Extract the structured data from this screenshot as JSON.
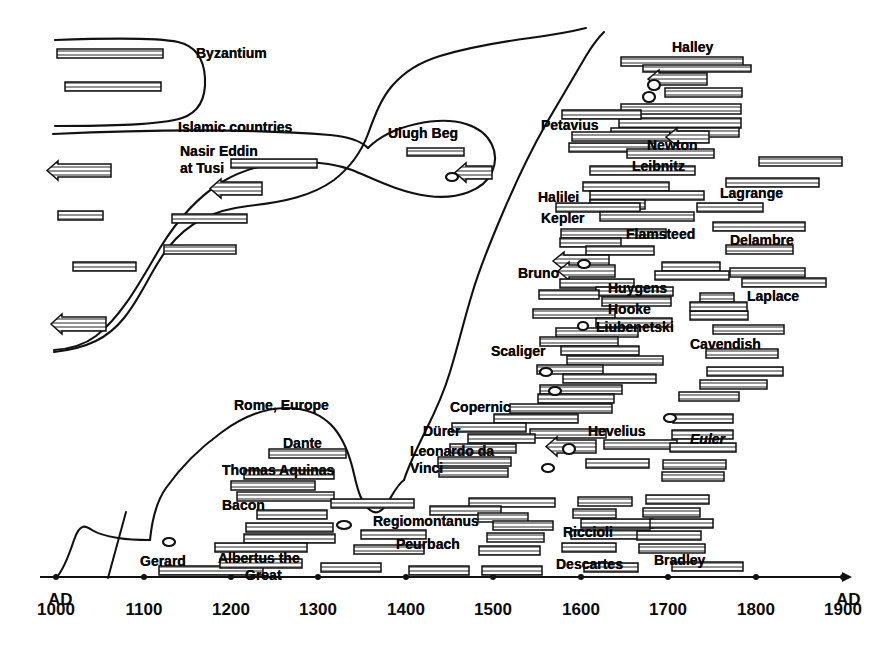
{
  "figure": {
    "kind": "historical-timeline",
    "background": "#ffffff",
    "ink": "#111111"
  },
  "axis": {
    "label_left": "1000\nAD",
    "label_right": "1900\nAD",
    "unit_suffix": "AD",
    "ticks": [
      {
        "value": 1000,
        "label": "1000",
        "x": 56
      },
      {
        "value": 1100,
        "label": "1100",
        "x": 144
      },
      {
        "value": 1200,
        "label": "1200",
        "x": 231
      },
      {
        "value": 1300,
        "label": "1300",
        "x": 318
      },
      {
        "value": 1400,
        "label": "1400",
        "x": 406
      },
      {
        "value": 1500,
        "label": "1500",
        "x": 493
      },
      {
        "value": 1600,
        "label": "1600",
        "x": 581
      },
      {
        "value": 1700,
        "label": "1700",
        "x": 668
      },
      {
        "value": 1800,
        "label": "1800",
        "x": 756
      },
      {
        "value": 1900,
        "label": "1900",
        "x": 843
      }
    ],
    "y": 577,
    "x_start": 40,
    "x_end": 850,
    "domain_min": 1000,
    "domain_max": 1900
  },
  "chart_data": {
    "type": "bar",
    "title": "",
    "xlabel": "AD",
    "ylabel": "",
    "xlim": [
      1000,
      1900
    ],
    "grid": false,
    "legend": "none",
    "note": "Horizontal hatched bars denote reign/life intervals of rulers and scholars; small ellipses denote very short intervals; left-pointing arrows denote intervals extending beyond the left edge of the plot. Curved freehand lines separate cultural regions.",
    "regions": [
      {
        "name": "Byzantium",
        "label_x": 196,
        "label_y": 46
      },
      {
        "name": "Islamic countries",
        "label_x": 178,
        "label_y": 120
      },
      {
        "name": "Nasir Eddin at Tusi",
        "label_x": 180,
        "label_y": 146
      },
      {
        "name": "Ulugh Beg",
        "label_x": 388,
        "label_y": 126
      },
      {
        "name": "Rome, Europe",
        "label_x": 234,
        "label_y": 398
      }
    ],
    "person_labels": [
      {
        "name": "Byzantium",
        "x": 196,
        "y": 46,
        "style": "plain"
      },
      {
        "name": "Islamic countries",
        "x": 178,
        "y": 120,
        "style": "plain"
      },
      {
        "name": "Nasir Eddin",
        "x": 180,
        "y": 144,
        "style": "plain"
      },
      {
        "name": "at Tusi",
        "x": 180,
        "y": 161,
        "style": "plain"
      },
      {
        "name": "Ulugh Beg",
        "x": 388,
        "y": 126,
        "style": "plain"
      },
      {
        "name": "Halley",
        "x": 672,
        "y": 40,
        "style": "plain"
      },
      {
        "name": "Petavius",
        "x": 541,
        "y": 118,
        "style": "plain"
      },
      {
        "name": "Newton",
        "x": 647,
        "y": 138,
        "style": "plain"
      },
      {
        "name": "Leibnitz",
        "x": 632,
        "y": 159,
        "style": "plain"
      },
      {
        "name": "Lagrange",
        "x": 720,
        "y": 186,
        "style": "plain"
      },
      {
        "name": "Halilei",
        "x": 538,
        "y": 190,
        "style": "plain"
      },
      {
        "name": "Kepler",
        "x": 541,
        "y": 211,
        "style": "plain"
      },
      {
        "name": "Flamsteed",
        "x": 626,
        "y": 227,
        "style": "plain"
      },
      {
        "name": "Delambre",
        "x": 730,
        "y": 233,
        "style": "plain"
      },
      {
        "name": "Bruno",
        "x": 518,
        "y": 266,
        "style": "plain"
      },
      {
        "name": "Huygens",
        "x": 608,
        "y": 281,
        "style": "plain"
      },
      {
        "name": "Laplace",
        "x": 747,
        "y": 289,
        "style": "plain"
      },
      {
        "name": "Hooke",
        "x": 608,
        "y": 302,
        "style": "plain"
      },
      {
        "name": "Liubenetski",
        "x": 596,
        "y": 320,
        "style": "plain"
      },
      {
        "name": "Cavendish",
        "x": 690,
        "y": 337,
        "style": "plain"
      },
      {
        "name": "Scaliger",
        "x": 491,
        "y": 344,
        "style": "plain"
      },
      {
        "name": "Copernic",
        "x": 450,
        "y": 400,
        "style": "plain"
      },
      {
        "name": "Rome, Europe",
        "x": 234,
        "y": 398,
        "style": "plain"
      },
      {
        "name": "Dante",
        "x": 283,
        "y": 436,
        "style": "plain"
      },
      {
        "name": "Hevelius",
        "x": 588,
        "y": 424,
        "style": "plain"
      },
      {
        "name": "Euler",
        "x": 690,
        "y": 432,
        "style": "italic"
      },
      {
        "name": "Dürer",
        "x": 423,
        "y": 424,
        "style": "plain"
      },
      {
        "name": "Leonardo da",
        "x": 410,
        "y": 444,
        "style": "plain"
      },
      {
        "name": "Vinci",
        "x": 410,
        "y": 461,
        "style": "plain"
      },
      {
        "name": "Thomas Aquinas",
        "x": 222,
        "y": 463,
        "style": "plain"
      },
      {
        "name": "Bacon",
        "x": 222,
        "y": 498,
        "style": "plain"
      },
      {
        "name": "Regiomontanus",
        "x": 373,
        "y": 514,
        "style": "plain"
      },
      {
        "name": "Riccioli",
        "x": 563,
        "y": 525,
        "style": "plain"
      },
      {
        "name": "Peurbach",
        "x": 396,
        "y": 537,
        "style": "plain"
      },
      {
        "name": "Gerard",
        "x": 140,
        "y": 554,
        "style": "plain"
      },
      {
        "name": "Albertus the",
        "x": 218,
        "y": 551,
        "style": "plain"
      },
      {
        "name": "Great",
        "x": 245,
        "y": 568,
        "style": "plain"
      },
      {
        "name": "Descartes",
        "x": 556,
        "y": 557,
        "style": "plain"
      },
      {
        "name": "Bradley",
        "x": 654,
        "y": 553,
        "style": "plain"
      }
    ],
    "bars": [
      {
        "x": 57,
        "y": 49,
        "w": 106,
        "h": 9,
        "arrow": false
      },
      {
        "x": 65,
        "y": 82,
        "w": 96,
        "h": 9,
        "arrow": false
      },
      {
        "x": 47,
        "y": 164,
        "w": 64,
        "h": 13,
        "arrow": true
      },
      {
        "x": 231,
        "y": 159,
        "w": 86,
        "h": 9,
        "arrow": false
      },
      {
        "x": 210,
        "y": 182,
        "w": 52,
        "h": 13,
        "arrow": true
      },
      {
        "x": 58,
        "y": 211,
        "w": 45,
        "h": 9,
        "arrow": false
      },
      {
        "x": 172,
        "y": 214,
        "w": 75,
        "h": 9,
        "arrow": false
      },
      {
        "x": 164,
        "y": 245,
        "w": 72,
        "h": 9,
        "arrow": false
      },
      {
        "x": 73,
        "y": 262,
        "w": 63,
        "h": 9,
        "arrow": false
      },
      {
        "x": 51,
        "y": 317,
        "w": 55,
        "h": 14,
        "arrow": true
      },
      {
        "x": 407,
        "y": 148,
        "w": 57,
        "h": 8,
        "arrow": false
      },
      {
        "x": 455,
        "y": 166,
        "w": 37,
        "h": 13,
        "arrow": true
      },
      {
        "x": 621,
        "y": 57,
        "w": 122,
        "h": 9,
        "arrow": false
      },
      {
        "x": 643,
        "y": 65,
        "w": 108,
        "h": 7,
        "arrow": false
      },
      {
        "x": 648,
        "y": 73,
        "w": 59,
        "h": 12,
        "arrow": true
      },
      {
        "x": 665,
        "y": 88,
        "w": 77,
        "h": 9,
        "arrow": false
      },
      {
        "x": 621,
        "y": 104,
        "w": 120,
        "h": 10,
        "arrow": false
      },
      {
        "x": 619,
        "y": 118,
        "w": 122,
        "h": 10,
        "arrow": false
      },
      {
        "x": 562,
        "y": 110,
        "w": 79,
        "h": 9,
        "arrow": false
      },
      {
        "x": 611,
        "y": 128,
        "w": 128,
        "h": 9,
        "arrow": false
      },
      {
        "x": 572,
        "y": 132,
        "w": 98,
        "h": 9,
        "arrow": false
      },
      {
        "x": 569,
        "y": 143,
        "w": 86,
        "h": 9,
        "arrow": false
      },
      {
        "x": 666,
        "y": 131,
        "w": 43,
        "h": 12,
        "arrow": true
      },
      {
        "x": 627,
        "y": 149,
        "w": 87,
        "h": 9,
        "arrow": false
      },
      {
        "x": 759,
        "y": 157,
        "w": 83,
        "h": 9,
        "arrow": false
      },
      {
        "x": 590,
        "y": 166,
        "w": 105,
        "h": 9,
        "arrow": false
      },
      {
        "x": 726,
        "y": 178,
        "w": 93,
        "h": 9,
        "arrow": false
      },
      {
        "x": 583,
        "y": 182,
        "w": 86,
        "h": 9,
        "arrow": false
      },
      {
        "x": 590,
        "y": 191,
        "w": 114,
        "h": 9,
        "arrow": false
      },
      {
        "x": 697,
        "y": 203,
        "w": 66,
        "h": 9,
        "arrow": false
      },
      {
        "x": 590,
        "y": 200,
        "w": 55,
        "h": 9,
        "arrow": false
      },
      {
        "x": 556,
        "y": 203,
        "w": 84,
        "h": 9,
        "arrow": false
      },
      {
        "x": 600,
        "y": 212,
        "w": 94,
        "h": 9,
        "arrow": false
      },
      {
        "x": 713,
        "y": 222,
        "w": 92,
        "h": 9,
        "arrow": false
      },
      {
        "x": 561,
        "y": 229,
        "w": 105,
        "h": 9,
        "arrow": false
      },
      {
        "x": 560,
        "y": 238,
        "w": 61,
        "h": 9,
        "arrow": false
      },
      {
        "x": 726,
        "y": 245,
        "w": 67,
        "h": 9,
        "arrow": false
      },
      {
        "x": 586,
        "y": 246,
        "w": 68,
        "h": 9,
        "arrow": false
      },
      {
        "x": 553,
        "y": 255,
        "w": 56,
        "h": 12,
        "arrow": true
      },
      {
        "x": 558,
        "y": 265,
        "w": 57,
        "h": 12,
        "arrow": true
      },
      {
        "x": 662,
        "y": 262,
        "w": 58,
        "h": 9,
        "arrow": false
      },
      {
        "x": 655,
        "y": 271,
        "w": 74,
        "h": 9,
        "arrow": false
      },
      {
        "x": 560,
        "y": 279,
        "w": 74,
        "h": 9,
        "arrow": false
      },
      {
        "x": 730,
        "y": 268,
        "w": 75,
        "h": 9,
        "arrow": false
      },
      {
        "x": 742,
        "y": 278,
        "w": 84,
        "h": 9,
        "arrow": false
      },
      {
        "x": 596,
        "y": 287,
        "w": 77,
        "h": 9,
        "arrow": false
      },
      {
        "x": 700,
        "y": 293,
        "w": 34,
        "h": 9,
        "arrow": false
      },
      {
        "x": 539,
        "y": 290,
        "w": 60,
        "h": 9,
        "arrow": false
      },
      {
        "x": 602,
        "y": 297,
        "w": 69,
        "h": 9,
        "arrow": false
      },
      {
        "x": 690,
        "y": 311,
        "w": 58,
        "h": 9,
        "arrow": false
      },
      {
        "x": 690,
        "y": 302,
        "w": 57,
        "h": 9,
        "arrow": false
      },
      {
        "x": 533,
        "y": 309,
        "w": 82,
        "h": 9,
        "arrow": false
      },
      {
        "x": 596,
        "y": 318,
        "w": 76,
        "h": 9,
        "arrow": false
      },
      {
        "x": 713,
        "y": 325,
        "w": 71,
        "h": 9,
        "arrow": false
      },
      {
        "x": 556,
        "y": 328,
        "w": 82,
        "h": 9,
        "arrow": false
      },
      {
        "x": 706,
        "y": 349,
        "w": 72,
        "h": 9,
        "arrow": false
      },
      {
        "x": 540,
        "y": 337,
        "w": 78,
        "h": 9,
        "arrow": false
      },
      {
        "x": 561,
        "y": 346,
        "w": 78,
        "h": 9,
        "arrow": false
      },
      {
        "x": 567,
        "y": 356,
        "w": 96,
        "h": 9,
        "arrow": false
      },
      {
        "x": 707,
        "y": 367,
        "w": 76,
        "h": 9,
        "arrow": false
      },
      {
        "x": 537,
        "y": 365,
        "w": 66,
        "h": 9,
        "arrow": false
      },
      {
        "x": 563,
        "y": 374,
        "w": 93,
        "h": 9,
        "arrow": false
      },
      {
        "x": 700,
        "y": 380,
        "w": 67,
        "h": 9,
        "arrow": false
      },
      {
        "x": 540,
        "y": 385,
        "w": 82,
        "h": 9,
        "arrow": false
      },
      {
        "x": 538,
        "y": 394,
        "w": 76,
        "h": 9,
        "arrow": false
      },
      {
        "x": 679,
        "y": 392,
        "w": 60,
        "h": 9,
        "arrow": false
      },
      {
        "x": 510,
        "y": 404,
        "w": 102,
        "h": 9,
        "arrow": false
      },
      {
        "x": 673,
        "y": 414,
        "w": 60,
        "h": 9,
        "arrow": false
      },
      {
        "x": 494,
        "y": 414,
        "w": 84,
        "h": 9,
        "arrow": false
      },
      {
        "x": 672,
        "y": 430,
        "w": 61,
        "h": 9,
        "arrow": false
      },
      {
        "x": 530,
        "y": 429,
        "w": 76,
        "h": 9,
        "arrow": false
      },
      {
        "x": 452,
        "y": 423,
        "w": 74,
        "h": 9,
        "arrow": false
      },
      {
        "x": 468,
        "y": 434,
        "w": 67,
        "h": 9,
        "arrow": false
      },
      {
        "x": 546,
        "y": 440,
        "w": 50,
        "h": 13,
        "arrow": true
      },
      {
        "x": 604,
        "y": 440,
        "w": 73,
        "h": 9,
        "arrow": false
      },
      {
        "x": 670,
        "y": 443,
        "w": 66,
        "h": 9,
        "arrow": false
      },
      {
        "x": 450,
        "y": 444,
        "w": 66,
        "h": 9,
        "arrow": false
      },
      {
        "x": 438,
        "y": 457,
        "w": 73,
        "h": 9,
        "arrow": false
      },
      {
        "x": 663,
        "y": 460,
        "w": 63,
        "h": 9,
        "arrow": false
      },
      {
        "x": 586,
        "y": 459,
        "w": 63,
        "h": 9,
        "arrow": false
      },
      {
        "x": 439,
        "y": 468,
        "w": 69,
        "h": 9,
        "arrow": false
      },
      {
        "x": 662,
        "y": 472,
        "w": 62,
        "h": 9,
        "arrow": false
      },
      {
        "x": 269,
        "y": 449,
        "w": 77,
        "h": 9,
        "arrow": false
      },
      {
        "x": 244,
        "y": 470,
        "w": 90,
        "h": 9,
        "arrow": false
      },
      {
        "x": 231,
        "y": 481,
        "w": 84,
        "h": 9,
        "arrow": false
      },
      {
        "x": 237,
        "y": 492,
        "w": 97,
        "h": 9,
        "arrow": false
      },
      {
        "x": 257,
        "y": 510,
        "w": 70,
        "h": 9,
        "arrow": false
      },
      {
        "x": 331,
        "y": 499,
        "w": 83,
        "h": 9,
        "arrow": false
      },
      {
        "x": 469,
        "y": 498,
        "w": 86,
        "h": 9,
        "arrow": false
      },
      {
        "x": 578,
        "y": 497,
        "w": 54,
        "h": 9,
        "arrow": false
      },
      {
        "x": 646,
        "y": 495,
        "w": 63,
        "h": 9,
        "arrow": false
      },
      {
        "x": 430,
        "y": 506,
        "w": 71,
        "h": 9,
        "arrow": false
      },
      {
        "x": 478,
        "y": 513,
        "w": 50,
        "h": 9,
        "arrow": false
      },
      {
        "x": 573,
        "y": 509,
        "w": 43,
        "h": 9,
        "arrow": false
      },
      {
        "x": 643,
        "y": 508,
        "w": 57,
        "h": 9,
        "arrow": false
      },
      {
        "x": 246,
        "y": 523,
        "w": 87,
        "h": 9,
        "arrow": false
      },
      {
        "x": 244,
        "y": 534,
        "w": 91,
        "h": 9,
        "arrow": false
      },
      {
        "x": 493,
        "y": 521,
        "w": 60,
        "h": 9,
        "arrow": false
      },
      {
        "x": 581,
        "y": 519,
        "w": 72,
        "h": 9,
        "arrow": false
      },
      {
        "x": 650,
        "y": 519,
        "w": 63,
        "h": 9,
        "arrow": false
      },
      {
        "x": 361,
        "y": 530,
        "w": 65,
        "h": 9,
        "arrow": false
      },
      {
        "x": 487,
        "y": 533,
        "w": 57,
        "h": 9,
        "arrow": false
      },
      {
        "x": 571,
        "y": 530,
        "w": 79,
        "h": 9,
        "arrow": false
      },
      {
        "x": 637,
        "y": 531,
        "w": 64,
        "h": 9,
        "arrow": false
      },
      {
        "x": 215,
        "y": 543,
        "w": 92,
        "h": 9,
        "arrow": false
      },
      {
        "x": 354,
        "y": 545,
        "w": 70,
        "h": 9,
        "arrow": false
      },
      {
        "x": 479,
        "y": 546,
        "w": 61,
        "h": 9,
        "arrow": false
      },
      {
        "x": 562,
        "y": 543,
        "w": 54,
        "h": 9,
        "arrow": false
      },
      {
        "x": 639,
        "y": 544,
        "w": 66,
        "h": 9,
        "arrow": false
      },
      {
        "x": 159,
        "y": 566,
        "w": 104,
        "h": 9,
        "arrow": false
      },
      {
        "x": 220,
        "y": 559,
        "w": 82,
        "h": 9,
        "arrow": false
      },
      {
        "x": 321,
        "y": 563,
        "w": 60,
        "h": 9,
        "arrow": false
      },
      {
        "x": 409,
        "y": 566,
        "w": 60,
        "h": 9,
        "arrow": false
      },
      {
        "x": 482,
        "y": 566,
        "w": 60,
        "h": 9,
        "arrow": false
      },
      {
        "x": 584,
        "y": 563,
        "w": 54,
        "h": 9,
        "arrow": false
      },
      {
        "x": 672,
        "y": 562,
        "w": 71,
        "h": 9,
        "arrow": false
      }
    ],
    "dots": [
      {
        "x": 452,
        "y": 177,
        "rx": 6,
        "ry": 4
      },
      {
        "x": 654,
        "y": 85,
        "rx": 6,
        "ry": 5
      },
      {
        "x": 649,
        "y": 97,
        "rx": 6,
        "ry": 5
      },
      {
        "x": 584,
        "y": 264,
        "rx": 6,
        "ry": 4
      },
      {
        "x": 583,
        "y": 326,
        "rx": 5,
        "ry": 4
      },
      {
        "x": 546,
        "y": 372,
        "rx": 6,
        "ry": 4
      },
      {
        "x": 555,
        "y": 391,
        "rx": 6,
        "ry": 4
      },
      {
        "x": 670,
        "y": 418,
        "rx": 6,
        "ry": 4
      },
      {
        "x": 569,
        "y": 449,
        "rx": 6,
        "ry": 5
      },
      {
        "x": 548,
        "y": 468,
        "rx": 6,
        "ry": 4
      },
      {
        "x": 344,
        "y": 525,
        "rx": 7,
        "ry": 4
      },
      {
        "x": 169,
        "y": 542,
        "rx": 6,
        "ry": 4
      }
    ]
  }
}
